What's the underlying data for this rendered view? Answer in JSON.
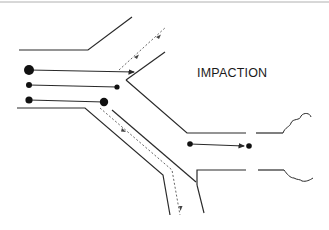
{
  "diagram": {
    "title": "IMPACTION",
    "colors": {
      "background": "#ffffff",
      "line": "#2a2a2a",
      "dashed": "#555555",
      "border": "#b0b0b0"
    },
    "elements": {
      "airway_walls": "branching airway with parent duct splitting into upper and lower branches plus a straight central channel",
      "particle_paths": [
        {
          "label": "large particle",
          "behavior": "impacts on carina wall"
        },
        {
          "label": "medium particle",
          "behavior": "follows central channel"
        },
        {
          "label": "particle",
          "behavior": "impacts at branch"
        }
      ],
      "airflow_streamlines": "dashed lines with arrowheads indicating airflow direction",
      "alveolar_ends": "cloud-like terminal shapes on right side"
    }
  }
}
